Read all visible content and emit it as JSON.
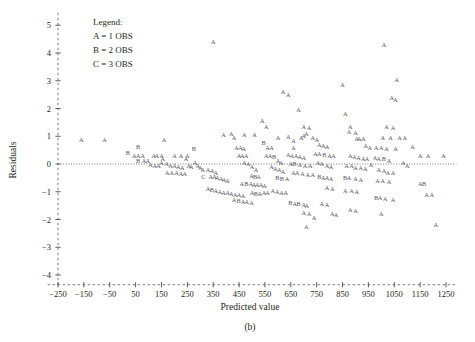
{
  "caption": "(b)",
  "legend": {
    "title": "Legend:",
    "entries": [
      "A = 1 OBS",
      "B = 2 OBS",
      "C = 3 OBS"
    ]
  },
  "chart_data": {
    "type": "scatter",
    "title": "",
    "xlabel": "Predicted value",
    "ylabel": "Residuals",
    "xlim": [
      -300,
      1300
    ],
    "ylim": [
      -4.5,
      5.5
    ],
    "xticks": [
      -250,
      -150,
      -50,
      50,
      150,
      250,
      350,
      450,
      550,
      650,
      750,
      850,
      950,
      1050,
      1150,
      1250
    ],
    "yticks": [
      5,
      4,
      3,
      2,
      1,
      0,
      -1,
      -2,
      -3,
      -4
    ],
    "grid": false,
    "reference_line": {
      "y": 0,
      "style": "dotted"
    },
    "marker_glyph": "A",
    "marker_color": "#55535a",
    "legend_position": "top-left",
    "points": [
      {
        "x": -160,
        "y": 0.86,
        "m": "A"
      },
      {
        "x": -70,
        "y": 0.86,
        "m": "A"
      },
      {
        "x": 60,
        "y": 0.62,
        "m": "B"
      },
      {
        "x": 20,
        "y": 0.4,
        "m": "B"
      },
      {
        "x": 45,
        "y": 0.3,
        "m": "A"
      },
      {
        "x": 60,
        "y": 0.3,
        "m": "A"
      },
      {
        "x": 78,
        "y": 0.3,
        "m": "A"
      },
      {
        "x": 60,
        "y": 0.1,
        "m": "B"
      },
      {
        "x": 82,
        "y": 0.1,
        "m": "A"
      },
      {
        "x": 97,
        "y": 0.1,
        "m": "A"
      },
      {
        "x": 160,
        "y": 0.86,
        "m": "A"
      },
      {
        "x": 150,
        "y": 0.3,
        "m": "A"
      },
      {
        "x": 155,
        "y": 0.2,
        "m": "A"
      },
      {
        "x": 200,
        "y": 0.3,
        "m": "A"
      },
      {
        "x": 225,
        "y": 0.3,
        "m": "A"
      },
      {
        "x": 250,
        "y": 0.3,
        "m": "A"
      },
      {
        "x": 245,
        "y": 0.18,
        "m": "A"
      },
      {
        "x": 275,
        "y": 0.55,
        "m": "B"
      },
      {
        "x": 280,
        "y": 0.05,
        "m": "A"
      },
      {
        "x": 290,
        "y": -0.05,
        "m": "A"
      },
      {
        "x": 255,
        "y": -0.05,
        "m": "A"
      },
      {
        "x": 265,
        "y": -0.1,
        "m": "A"
      },
      {
        "x": 300,
        "y": -0.15,
        "m": "A"
      },
      {
        "x": 310,
        "y": -0.22,
        "m": "A"
      },
      {
        "x": 330,
        "y": -0.2,
        "m": "A"
      },
      {
        "x": 345,
        "y": -0.25,
        "m": "A"
      },
      {
        "x": 360,
        "y": -0.3,
        "m": "A"
      },
      {
        "x": 312,
        "y": -0.45,
        "m": "C"
      },
      {
        "x": 340,
        "y": -0.45,
        "m": "A"
      },
      {
        "x": 355,
        "y": -0.45,
        "m": "A"
      },
      {
        "x": 366,
        "y": -0.48,
        "m": "A"
      },
      {
        "x": 380,
        "y": -0.55,
        "m": "A"
      },
      {
        "x": 392,
        "y": -0.58,
        "m": "A"
      },
      {
        "x": 405,
        "y": -0.6,
        "m": "A"
      },
      {
        "x": 350,
        "y": 4.4,
        "m": "A"
      },
      {
        "x": 390,
        "y": 1.05,
        "m": "A"
      },
      {
        "x": 420,
        "y": 1.1,
        "m": "A"
      },
      {
        "x": 430,
        "y": 0.95,
        "m": "A"
      },
      {
        "x": 440,
        "y": 0.6,
        "m": "A"
      },
      {
        "x": 455,
        "y": 0.58,
        "m": "A"
      },
      {
        "x": 468,
        "y": 0.55,
        "m": "A"
      },
      {
        "x": 450,
        "y": 0.3,
        "m": "A"
      },
      {
        "x": 462,
        "y": 0.3,
        "m": "A"
      },
      {
        "x": 478,
        "y": 0.28,
        "m": "A"
      },
      {
        "x": 470,
        "y": 0.05,
        "m": "A"
      },
      {
        "x": 485,
        "y": 0.0,
        "m": "A"
      },
      {
        "x": 500,
        "y": -0.1,
        "m": "A"
      },
      {
        "x": 515,
        "y": -0.2,
        "m": "A"
      },
      {
        "x": 498,
        "y": -0.42,
        "m": "A"
      },
      {
        "x": 512,
        "y": -0.45,
        "m": "B"
      },
      {
        "x": 525,
        "y": -0.46,
        "m": "A"
      },
      {
        "x": 460,
        "y": -0.7,
        "m": "A"
      },
      {
        "x": 478,
        "y": -0.7,
        "m": "B"
      },
      {
        "x": 495,
        "y": -0.72,
        "m": "A"
      },
      {
        "x": 508,
        "y": -0.74,
        "m": "A"
      },
      {
        "x": 520,
        "y": -0.75,
        "m": "A"
      },
      {
        "x": 535,
        "y": -0.75,
        "m": "A"
      },
      {
        "x": 548,
        "y": -0.78,
        "m": "A"
      },
      {
        "x": 500,
        "y": -1.05,
        "m": "A"
      },
      {
        "x": 515,
        "y": -1.06,
        "m": "B"
      },
      {
        "x": 530,
        "y": -1.08,
        "m": "A"
      },
      {
        "x": 546,
        "y": -1.05,
        "m": "A"
      },
      {
        "x": 560,
        "y": -1.05,
        "m": "A"
      },
      {
        "x": 545,
        "y": 0.75,
        "m": "B"
      },
      {
        "x": 560,
        "y": 0.6,
        "m": "A"
      },
      {
        "x": 575,
        "y": 0.58,
        "m": "A"
      },
      {
        "x": 555,
        "y": 0.3,
        "m": "A"
      },
      {
        "x": 570,
        "y": 0.28,
        "m": "A"
      },
      {
        "x": 585,
        "y": 0.25,
        "m": "B"
      },
      {
        "x": 600,
        "y": 0.1,
        "m": "A"
      },
      {
        "x": 612,
        "y": 0.05,
        "m": "A"
      },
      {
        "x": 575,
        "y": -0.1,
        "m": "A"
      },
      {
        "x": 590,
        "y": -0.18,
        "m": "A"
      },
      {
        "x": 605,
        "y": -0.22,
        "m": "A"
      },
      {
        "x": 620,
        "y": -0.28,
        "m": "A"
      },
      {
        "x": 598,
        "y": -0.5,
        "m": "B"
      },
      {
        "x": 615,
        "y": -0.52,
        "m": "B"
      },
      {
        "x": 635,
        "y": -0.55,
        "m": "A"
      },
      {
        "x": 580,
        "y": -0.95,
        "m": "A"
      },
      {
        "x": 598,
        "y": -1.0,
        "m": "A"
      },
      {
        "x": 614,
        "y": -1.02,
        "m": "A"
      },
      {
        "x": 630,
        "y": -1.05,
        "m": "A"
      },
      {
        "x": 648,
        "y": -1.4,
        "m": "B"
      },
      {
        "x": 665,
        "y": -1.42,
        "m": "A"
      },
      {
        "x": 680,
        "y": -1.45,
        "m": "B"
      },
      {
        "x": 700,
        "y": -1.48,
        "m": "A"
      },
      {
        "x": 712,
        "y": -1.5,
        "m": "A"
      },
      {
        "x": 700,
        "y": -1.75,
        "m": "A"
      },
      {
        "x": 720,
        "y": -1.78,
        "m": "A"
      },
      {
        "x": 620,
        "y": 2.6,
        "m": "A"
      },
      {
        "x": 640,
        "y": 2.5,
        "m": "A"
      },
      {
        "x": 680,
        "y": 1.95,
        "m": "A"
      },
      {
        "x": 700,
        "y": 1.35,
        "m": "A"
      },
      {
        "x": 720,
        "y": 1.32,
        "m": "A"
      },
      {
        "x": 710,
        "y": 1.1,
        "m": "A"
      },
      {
        "x": 700,
        "y": 1.0,
        "m": "A"
      },
      {
        "x": 690,
        "y": 0.95,
        "m": "A"
      },
      {
        "x": 660,
        "y": 0.85,
        "m": "A"
      },
      {
        "x": 735,
        "y": 0.95,
        "m": "A"
      },
      {
        "x": 750,
        "y": 0.88,
        "m": "A"
      },
      {
        "x": 760,
        "y": 0.7,
        "m": "A"
      },
      {
        "x": 775,
        "y": 0.65,
        "m": "A"
      },
      {
        "x": 790,
        "y": 0.62,
        "m": "A"
      },
      {
        "x": 745,
        "y": 0.38,
        "m": "A"
      },
      {
        "x": 760,
        "y": 0.35,
        "m": "A"
      },
      {
        "x": 780,
        "y": 0.32,
        "m": "B"
      },
      {
        "x": 800,
        "y": 0.3,
        "m": "A"
      },
      {
        "x": 815,
        "y": 0.28,
        "m": "A"
      },
      {
        "x": 755,
        "y": 0.05,
        "m": "A"
      },
      {
        "x": 770,
        "y": 0.0,
        "m": "A"
      },
      {
        "x": 790,
        "y": -0.05,
        "m": "A"
      },
      {
        "x": 805,
        "y": -0.1,
        "m": "A"
      },
      {
        "x": 760,
        "y": -0.45,
        "m": "B"
      },
      {
        "x": 775,
        "y": -0.48,
        "m": "A"
      },
      {
        "x": 790,
        "y": -0.5,
        "m": "A"
      },
      {
        "x": 805,
        "y": -0.52,
        "m": "A"
      },
      {
        "x": 790,
        "y": -0.85,
        "m": "A"
      },
      {
        "x": 810,
        "y": -0.88,
        "m": "A"
      },
      {
        "x": 770,
        "y": -1.45,
        "m": "A"
      },
      {
        "x": 790,
        "y": -1.48,
        "m": "A"
      },
      {
        "x": 810,
        "y": -1.8,
        "m": "A"
      },
      {
        "x": 825,
        "y": -1.82,
        "m": "A"
      },
      {
        "x": 850,
        "y": 2.85,
        "m": "A"
      },
      {
        "x": 860,
        "y": 1.8,
        "m": "A"
      },
      {
        "x": 880,
        "y": 1.35,
        "m": "A"
      },
      {
        "x": 875,
        "y": 1.15,
        "m": "A"
      },
      {
        "x": 900,
        "y": 1.12,
        "m": "A"
      },
      {
        "x": 905,
        "y": 0.9,
        "m": "A"
      },
      {
        "x": 915,
        "y": 0.9,
        "m": "A"
      },
      {
        "x": 930,
        "y": 0.9,
        "m": "A"
      },
      {
        "x": 940,
        "y": 0.65,
        "m": "A"
      },
      {
        "x": 955,
        "y": 0.6,
        "m": "A"
      },
      {
        "x": 880,
        "y": 0.3,
        "m": "A"
      },
      {
        "x": 895,
        "y": 0.25,
        "m": "A"
      },
      {
        "x": 912,
        "y": 0.22,
        "m": "A"
      },
      {
        "x": 930,
        "y": 0.2,
        "m": "A"
      },
      {
        "x": 945,
        "y": 0.18,
        "m": "A"
      },
      {
        "x": 865,
        "y": -0.05,
        "m": "A"
      },
      {
        "x": 885,
        "y": -0.08,
        "m": "A"
      },
      {
        "x": 900,
        "y": -0.12,
        "m": "A"
      },
      {
        "x": 920,
        "y": -0.15,
        "m": "A"
      },
      {
        "x": 938,
        "y": -0.18,
        "m": "A"
      },
      {
        "x": 860,
        "y": -0.48,
        "m": "B"
      },
      {
        "x": 875,
        "y": -0.5,
        "m": "A"
      },
      {
        "x": 900,
        "y": -0.55,
        "m": "A"
      },
      {
        "x": 920,
        "y": -0.58,
        "m": "A"
      },
      {
        "x": 860,
        "y": -0.95,
        "m": "A"
      },
      {
        "x": 885,
        "y": -0.98,
        "m": "A"
      },
      {
        "x": 905,
        "y": -1.0,
        "m": "A"
      },
      {
        "x": 880,
        "y": -1.65,
        "m": "A"
      },
      {
        "x": 900,
        "y": -1.68,
        "m": "A"
      },
      {
        "x": 1010,
        "y": 4.3,
        "m": "A"
      },
      {
        "x": 1060,
        "y": 3.05,
        "m": "A"
      },
      {
        "x": 1040,
        "y": 2.4,
        "m": "A"
      },
      {
        "x": 1055,
        "y": 2.3,
        "m": "A"
      },
      {
        "x": 1020,
        "y": 1.35,
        "m": "A"
      },
      {
        "x": 1045,
        "y": 1.32,
        "m": "A"
      },
      {
        "x": 1005,
        "y": 0.95,
        "m": "A"
      },
      {
        "x": 1035,
        "y": 0.95,
        "m": "A"
      },
      {
        "x": 1070,
        "y": 0.95,
        "m": "A"
      },
      {
        "x": 980,
        "y": 0.6,
        "m": "A"
      },
      {
        "x": 1000,
        "y": 0.58,
        "m": "A"
      },
      {
        "x": 1020,
        "y": 0.55,
        "m": "A"
      },
      {
        "x": 1055,
        "y": 0.55,
        "m": "A"
      },
      {
        "x": 975,
        "y": 0.22,
        "m": "A"
      },
      {
        "x": 990,
        "y": 0.2,
        "m": "A"
      },
      {
        "x": 1010,
        "y": 0.18,
        "m": "B"
      },
      {
        "x": 1030,
        "y": 0.12,
        "m": "A"
      },
      {
        "x": 990,
        "y": -0.2,
        "m": "A"
      },
      {
        "x": 1010,
        "y": -0.25,
        "m": "A"
      },
      {
        "x": 1025,
        "y": -0.3,
        "m": "A"
      },
      {
        "x": 1045,
        "y": -0.32,
        "m": "A"
      },
      {
        "x": 985,
        "y": -0.6,
        "m": "A"
      },
      {
        "x": 1005,
        "y": -0.62,
        "m": "A"
      },
      {
        "x": 1030,
        "y": -0.65,
        "m": "A"
      },
      {
        "x": 980,
        "y": -1.2,
        "m": "B"
      },
      {
        "x": 995,
        "y": -1.22,
        "m": "A"
      },
      {
        "x": 1015,
        "y": -1.25,
        "m": "A"
      },
      {
        "x": 1045,
        "y": -1.28,
        "m": "A"
      },
      {
        "x": 1000,
        "y": -1.8,
        "m": "A"
      },
      {
        "x": 1090,
        "y": 0.95,
        "m": "A"
      },
      {
        "x": 1120,
        "y": 0.62,
        "m": "A"
      },
      {
        "x": 1150,
        "y": 0.3,
        "m": "A"
      },
      {
        "x": 1180,
        "y": 0.28,
        "m": "A"
      },
      {
        "x": 1100,
        "y": -0.08,
        "m": "A"
      },
      {
        "x": 1150,
        "y": -0.7,
        "m": "A"
      },
      {
        "x": 1165,
        "y": -0.72,
        "m": "B"
      },
      {
        "x": 1175,
        "y": -1.1,
        "m": "A"
      },
      {
        "x": 1195,
        "y": -1.12,
        "m": "A"
      },
      {
        "x": 1210,
        "y": -2.2,
        "m": "A"
      },
      {
        "x": 710,
        "y": -2.25,
        "m": "A"
      },
      {
        "x": 740,
        "y": -1.95,
        "m": "A"
      },
      {
        "x": 360,
        "y": -0.95,
        "m": "A"
      },
      {
        "x": 375,
        "y": -1.0,
        "m": "A"
      },
      {
        "x": 390,
        "y": -1.02,
        "m": "A"
      },
      {
        "x": 405,
        "y": -1.05,
        "m": "A"
      },
      {
        "x": 420,
        "y": -1.08,
        "m": "A"
      },
      {
        "x": 435,
        "y": -1.1,
        "m": "A"
      },
      {
        "x": 450,
        "y": -1.12,
        "m": "A"
      },
      {
        "x": 465,
        "y": -1.15,
        "m": "A"
      },
      {
        "x": 430,
        "y": -1.3,
        "m": "A"
      },
      {
        "x": 448,
        "y": -1.32,
        "m": "B"
      },
      {
        "x": 465,
        "y": -1.35,
        "m": "A"
      },
      {
        "x": 480,
        "y": -1.38,
        "m": "A"
      },
      {
        "x": 498,
        "y": -1.4,
        "m": "A"
      },
      {
        "x": 330,
        "y": -0.9,
        "m": "A"
      },
      {
        "x": 345,
        "y": -0.92,
        "m": "B"
      },
      {
        "x": 150,
        "y": 0.05,
        "m": "A"
      },
      {
        "x": 170,
        "y": 0.0,
        "m": "A"
      },
      {
        "x": 185,
        "y": -0.05,
        "m": "A"
      },
      {
        "x": 200,
        "y": -0.08,
        "m": "A"
      },
      {
        "x": 215,
        "y": -0.1,
        "m": "A"
      },
      {
        "x": 230,
        "y": -0.12,
        "m": "A"
      },
      {
        "x": 172,
        "y": -0.3,
        "m": "A"
      },
      {
        "x": 190,
        "y": -0.32,
        "m": "A"
      },
      {
        "x": 208,
        "y": -0.33,
        "m": "A"
      },
      {
        "x": 225,
        "y": -0.35,
        "m": "A"
      },
      {
        "x": 240,
        "y": -0.36,
        "m": "A"
      },
      {
        "x": 120,
        "y": 0.3,
        "m": "A"
      },
      {
        "x": 132,
        "y": 0.28,
        "m": "A"
      },
      {
        "x": 108,
        "y": -0.02,
        "m": "A"
      },
      {
        "x": 124,
        "y": -0.05,
        "m": "A"
      },
      {
        "x": 138,
        "y": -0.08,
        "m": "A"
      },
      {
        "x": 1085,
        "y": 0.05,
        "m": "A"
      },
      {
        "x": 1240,
        "y": 0.3,
        "m": "A"
      },
      {
        "x": 960,
        "y": -0.02,
        "m": "A"
      },
      {
        "x": 540,
        "y": 1.55,
        "m": "A"
      },
      {
        "x": 555,
        "y": 1.35,
        "m": "A"
      },
      {
        "x": 510,
        "y": 1.05,
        "m": "A"
      },
      {
        "x": 470,
        "y": 1.05,
        "m": "A"
      },
      {
        "x": 640,
        "y": 0.98,
        "m": "A"
      },
      {
        "x": 600,
        "y": 0.95,
        "m": "A"
      },
      {
        "x": 660,
        "y": 0.6,
        "m": "A"
      },
      {
        "x": 640,
        "y": 0.32,
        "m": "A"
      },
      {
        "x": 655,
        "y": 0.3,
        "m": "A"
      },
      {
        "x": 670,
        "y": 0.28,
        "m": "A"
      },
      {
        "x": 685,
        "y": 0.26,
        "m": "A"
      },
      {
        "x": 700,
        "y": 0.24,
        "m": "A"
      },
      {
        "x": 650,
        "y": 0.02,
        "m": "A"
      },
      {
        "x": 665,
        "y": 0.0,
        "m": "B"
      },
      {
        "x": 685,
        "y": -0.02,
        "m": "A"
      },
      {
        "x": 705,
        "y": -0.05,
        "m": "A"
      },
      {
        "x": 725,
        "y": -0.08,
        "m": "A"
      },
      {
        "x": 660,
        "y": -0.3,
        "m": "A"
      },
      {
        "x": 675,
        "y": -0.32,
        "m": "A"
      },
      {
        "x": 695,
        "y": -0.35,
        "m": "A"
      },
      {
        "x": 715,
        "y": -0.38,
        "m": "A"
      },
      {
        "x": 735,
        "y": -0.4,
        "m": "A"
      }
    ]
  }
}
